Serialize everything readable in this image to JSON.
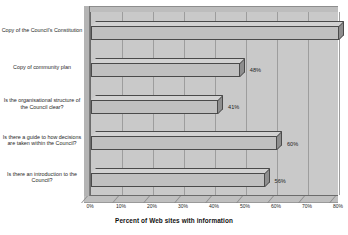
{
  "chart_data": {
    "type": "bar",
    "orientation": "horizontal",
    "title": "",
    "xlabel": "Percent of Web sites with information",
    "ylabel": "",
    "xlim": [
      0,
      80
    ],
    "grid": true,
    "legend": null,
    "categories": [
      "Copy of the Council's Constitution",
      "Copy of community plan",
      "Is the organisational structure of the Council clear?",
      "Is there a guide to how decisions are taken within the Council?",
      "Is there an introduction to the Council?"
    ],
    "values": [
      80,
      48,
      41,
      60,
      56
    ],
    "data_labels": [
      "80%",
      "48%",
      "41%",
      "60%",
      "56%"
    ],
    "xticks": [
      0,
      10,
      20,
      30,
      40,
      50,
      60,
      70,
      80
    ],
    "xtick_labels": [
      "0%",
      "10%",
      "20%",
      "30%",
      "40%",
      "50%",
      "60%",
      "70%",
      "80%"
    ],
    "colors": {
      "bar_face": "#c0c0c0",
      "bar_top": "#d2d2d2",
      "bar_side": "#8e8e8e",
      "bar_edge": "#4a4a4a",
      "plot_background": "#c9c9c9",
      "gridline": "#9d9d9d",
      "page_background": "#ffffff",
      "text": "#1f1f1f"
    }
  }
}
